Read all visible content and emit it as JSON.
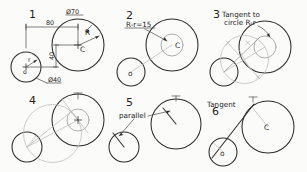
{
  "drawing": {
    "title_present": false,
    "background_color": "#fbfbfa",
    "ink_color": "#2b2b2b",
    "light_ink_color": "#9a9a98",
    "panels": [
      {
        "step": "1",
        "notes": [],
        "dimensions": [
          {
            "id": "dia_large",
            "text": "Ø70"
          },
          {
            "id": "horiz_center_distance",
            "text": "80"
          },
          {
            "id": "vert_center_distance",
            "text": "40"
          },
          {
            "id": "dia_small",
            "text": "Ø40"
          }
        ],
        "point_labels": [
          {
            "id": "radius_large",
            "text": "R"
          },
          {
            "id": "center_large",
            "text": "C"
          },
          {
            "id": "radius_small",
            "text": "r"
          },
          {
            "id": "center_small",
            "text": "o"
          }
        ]
      },
      {
        "step": "2",
        "notes": [
          {
            "id": "construction_radius",
            "text": "R-r=15"
          }
        ],
        "dimensions": [],
        "point_labels": [
          {
            "id": "center_large",
            "text": "C"
          },
          {
            "id": "center_small",
            "text": "o"
          }
        ]
      },
      {
        "step": "3",
        "notes": [
          {
            "id": "tangent_note_line1",
            "text": "Tangent to"
          },
          {
            "id": "tangent_note_line2",
            "text": "circle R-r"
          }
        ],
        "dimensions": [],
        "point_labels": []
      },
      {
        "step": "4",
        "notes": [],
        "dimensions": [],
        "point_labels": []
      },
      {
        "step": "5",
        "notes": [
          {
            "id": "parallel_note",
            "text": "parallel"
          }
        ],
        "dimensions": [],
        "point_labels": []
      },
      {
        "step": "6",
        "notes": [
          {
            "id": "tangent_note",
            "text": "Tangent"
          }
        ],
        "dimensions": [],
        "point_labels": [
          {
            "id": "center_large",
            "text": "C"
          },
          {
            "id": "center_small",
            "text": "o"
          }
        ]
      }
    ]
  }
}
